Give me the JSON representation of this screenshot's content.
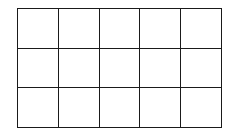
{
  "diagram": {
    "type": "grid",
    "rows": 3,
    "columns": 5,
    "line_color": "#1a1a1a",
    "background_color": "#ffffff",
    "cells": [
      [
        "",
        "",
        "",
        "",
        ""
      ],
      [
        "",
        "",
        "",
        "",
        ""
      ],
      [
        "",
        "",
        "",
        "",
        ""
      ]
    ]
  }
}
